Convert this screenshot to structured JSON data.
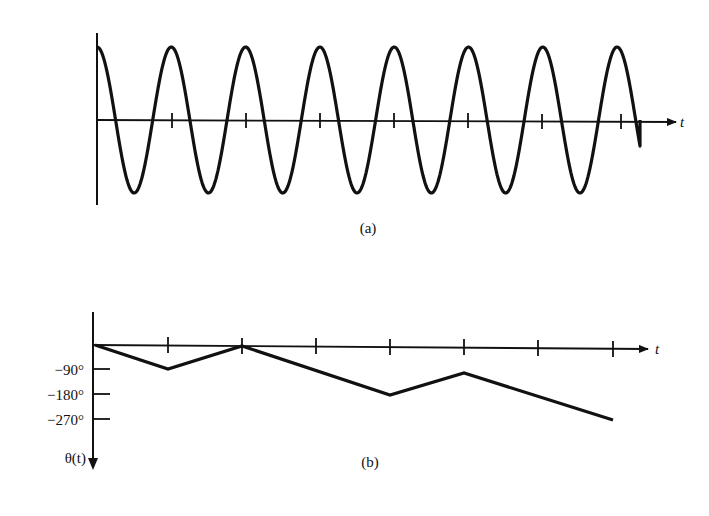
{
  "figure": {
    "panel_a": {
      "caption": "(a)",
      "x_axis_label": "t",
      "signal": "constant-amplitude sinusoid, starts at positive peak, ~7.5 cycles",
      "tick_count": 7
    },
    "panel_b": {
      "caption": "(b)",
      "x_axis_label": "t",
      "y_axis_label": "θ(t)",
      "y_tick_labels": [
        "−90°",
        "−180°",
        "−270°"
      ],
      "tick_count": 7
    }
  },
  "chart_data": [
    {
      "type": "line",
      "title": "(a)",
      "xlabel": "t",
      "ylabel": "",
      "description": "Sinusoid of constant amplitude; period equals one tick interval; starts at a maximum at t=0 and ends at a zero crossing after ~7.5 periods",
      "x": [
        0,
        0.5,
        1,
        1.5,
        2,
        2.5,
        3,
        3.5,
        4,
        4.5,
        5,
        5.5,
        6,
        6.5,
        7,
        7.25
      ],
      "values": [
        1,
        -1,
        1,
        -1,
        1,
        -1,
        1,
        -1,
        1,
        -1,
        1,
        -1,
        1,
        -1,
        1,
        0
      ],
      "x_ticks": [
        1,
        2,
        3,
        4,
        5,
        6,
        7
      ],
      "ylim": [
        -1,
        1
      ],
      "grid": false
    },
    {
      "type": "line",
      "title": "(b)",
      "xlabel": "t",
      "ylabel": "θ(t)",
      "description": "Piecewise-linear phase θ(t) in degrees, y axis positive up at origin, downward increasingly negative",
      "x": [
        0,
        1,
        2,
        4,
        5,
        7
      ],
      "values": [
        0,
        -90,
        0,
        -180,
        -90,
        -270
      ],
      "x_ticks": [
        1,
        2,
        3,
        4,
        5,
        6,
        7
      ],
      "y_ticks": [
        -90,
        -180,
        -270
      ],
      "y_tick_labels": [
        "−90°",
        "−180°",
        "−270°"
      ],
      "ylim": [
        -300,
        0
      ],
      "grid": false
    }
  ]
}
